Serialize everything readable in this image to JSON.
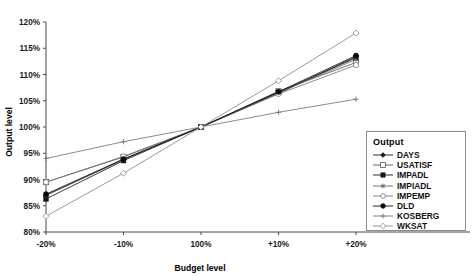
{
  "chart_data": {
    "type": "line",
    "title": "",
    "xlabel": "Budget level",
    "ylabel": "Output level",
    "categories": [
      "-20%",
      "-10%",
      "100%",
      "+10%",
      "+20%"
    ],
    "ylim": [
      80,
      120
    ],
    "yticks": [
      "80%",
      "85%",
      "90%",
      "95%",
      "100%",
      "105%",
      "110%",
      "115%",
      "120%"
    ],
    "ytick_values": [
      80,
      85,
      90,
      95,
      100,
      105,
      110,
      115,
      120
    ],
    "grid": false,
    "legend_position": "right-bottom",
    "legend_title": "Output",
    "series": [
      {
        "name": "DAYS",
        "marker": "filled-diamond",
        "color": "#1a1a1a",
        "values": [
          87.0,
          93.8,
          100.0,
          106.4,
          113.4
        ]
      },
      {
        "name": "USATISF",
        "marker": "open-square",
        "color": "#555555",
        "values": [
          89.5,
          94.3,
          100.0,
          106.8,
          112.3
        ]
      },
      {
        "name": "IMPADL",
        "marker": "filled-square",
        "color": "#1a1a1a",
        "values": [
          86.3,
          93.6,
          100.0,
          106.6,
          113.2
        ]
      },
      {
        "name": "IMPIADL",
        "marker": "star",
        "color": "#666666",
        "values": [
          87.0,
          93.8,
          100.0,
          106.5,
          112.9
        ]
      },
      {
        "name": "IMPEMP",
        "marker": "open-circle",
        "color": "#777777",
        "values": [
          89.5,
          94.4,
          100.0,
          106.3,
          111.8
        ]
      },
      {
        "name": "DLD",
        "marker": "filled-circle",
        "color": "#0d0d0d",
        "values": [
          87.2,
          93.9,
          100.0,
          106.7,
          113.6
        ]
      },
      {
        "name": "KOSBERG",
        "marker": "plus",
        "color": "#777777",
        "values": [
          94.0,
          97.2,
          100.0,
          102.8,
          105.3
        ]
      },
      {
        "name": "WKSAT",
        "marker": "open-diamond",
        "color": "#888888",
        "values": [
          83.0,
          91.2,
          100.0,
          108.8,
          117.9
        ]
      }
    ]
  }
}
